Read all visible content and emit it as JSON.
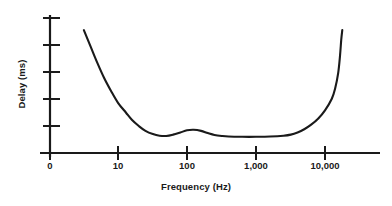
{
  "chart_data": {
    "type": "line",
    "title": "",
    "subtitle": "",
    "xlabel": "Frequency (Hz)",
    "ylabel": "Delay (ms)",
    "x_scale": "log",
    "y_scale": "linear",
    "grid": false,
    "legend": null,
    "xticks": [
      {
        "label": "0",
        "value": 0
      },
      {
        "label": "10",
        "value": 10
      },
      {
        "label": "100",
        "value": 100
      },
      {
        "label": "1,000",
        "value": 1000
      },
      {
        "label": "10,000",
        "value": 10000
      }
    ],
    "yticks": [
      {
        "label": "",
        "value": 0
      },
      {
        "label": "",
        "value": 1
      },
      {
        "label": "",
        "value": 2
      },
      {
        "label": "",
        "value": 3
      },
      {
        "label": "",
        "value": 4
      },
      {
        "label": "",
        "value": 5
      }
    ],
    "xlim": [
      0,
      40000
    ],
    "ylim": [
      0,
      5
    ],
    "annotations": [],
    "series": [
      {
        "name": "Delay vs Frequency",
        "color": "#1a1a1a",
        "points": [
          {
            "x": 3.2,
            "y": 4.55
          },
          {
            "x": 4.0,
            "y": 3.95
          },
          {
            "x": 5.0,
            "y": 3.35
          },
          {
            "x": 6.3,
            "y": 2.78
          },
          {
            "x": 8.0,
            "y": 2.28
          },
          {
            "x": 10.0,
            "y": 1.86
          },
          {
            "x": 13.0,
            "y": 1.5
          },
          {
            "x": 16.0,
            "y": 1.22
          },
          {
            "x": 20.0,
            "y": 1.0
          },
          {
            "x": 25.0,
            "y": 0.82
          },
          {
            "x": 32.0,
            "y": 0.7
          },
          {
            "x": 40.0,
            "y": 0.64
          },
          {
            "x": 50.0,
            "y": 0.63
          },
          {
            "x": 63.0,
            "y": 0.68
          },
          {
            "x": 80.0,
            "y": 0.76
          },
          {
            "x": 100.0,
            "y": 0.84
          },
          {
            "x": 125.0,
            "y": 0.86
          },
          {
            "x": 160.0,
            "y": 0.82
          },
          {
            "x": 200.0,
            "y": 0.74
          },
          {
            "x": 250.0,
            "y": 0.67
          },
          {
            "x": 320.0,
            "y": 0.63
          },
          {
            "x": 400.0,
            "y": 0.61
          },
          {
            "x": 630.0,
            "y": 0.6
          },
          {
            "x": 1000.0,
            "y": 0.6
          },
          {
            "x": 1600.0,
            "y": 0.61
          },
          {
            "x": 2500.0,
            "y": 0.64
          },
          {
            "x": 3200.0,
            "y": 0.68
          },
          {
            "x": 4000.0,
            "y": 0.76
          },
          {
            "x": 5000.0,
            "y": 0.88
          },
          {
            "x": 6300.0,
            "y": 1.05
          },
          {
            "x": 8000.0,
            "y": 1.28
          },
          {
            "x": 10000.0,
            "y": 1.58
          },
          {
            "x": 12500.0,
            "y": 2.0
          },
          {
            "x": 14000.0,
            "y": 2.38
          },
          {
            "x": 15500.0,
            "y": 2.95
          },
          {
            "x": 16500.0,
            "y": 3.6
          },
          {
            "x": 17200.0,
            "y": 4.2
          },
          {
            "x": 17800.0,
            "y": 4.55
          }
        ]
      }
    ]
  },
  "axes": {
    "line_color": "#1a1a1a",
    "curve_color": "#1a1a1a"
  }
}
